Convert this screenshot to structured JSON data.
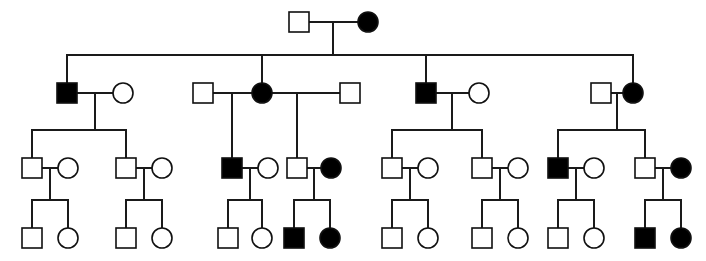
{
  "diagram": {
    "type": "pedigree-chart",
    "generations": 4,
    "symbol_legend": {
      "square": "male",
      "circle": "female",
      "filled": "affected individual",
      "open": "unaffected individual"
    },
    "colors": {
      "affected_fill": "#000000",
      "unaffected_fill": "#ffffff",
      "stroke": "#101010",
      "line": "#1a1a1a",
      "background": "#ffffff"
    },
    "geometry": {
      "width": 706,
      "height": 261,
      "square_size": 20,
      "circle_radius": 10,
      "generation_y": [
        22,
        93,
        168,
        238
      ]
    },
    "counts": {
      "total_individuals": 52,
      "affected_total": 13,
      "affected_males": 6,
      "affected_females": 7
    },
    "individuals": [
      {
        "id": "I-1",
        "generation": 1,
        "sex": "male",
        "affected": false,
        "x": 299,
        "y": 22
      },
      {
        "id": "I-2",
        "generation": 1,
        "sex": "female",
        "affected": true,
        "x": 368,
        "y": 22
      },
      {
        "id": "II-1",
        "generation": 2,
        "sex": "male",
        "affected": true,
        "x": 67,
        "y": 93
      },
      {
        "id": "II-2",
        "generation": 2,
        "sex": "female",
        "affected": false,
        "x": 123,
        "y": 93
      },
      {
        "id": "II-3",
        "generation": 2,
        "sex": "male",
        "affected": false,
        "x": 203,
        "y": 93
      },
      {
        "id": "II-4",
        "generation": 2,
        "sex": "female",
        "affected": true,
        "x": 262,
        "y": 93
      },
      {
        "id": "II-5",
        "generation": 2,
        "sex": "male",
        "affected": false,
        "x": 350,
        "y": 93
      },
      {
        "id": "II-6",
        "generation": 2,
        "sex": "male",
        "affected": true,
        "x": 426,
        "y": 93
      },
      {
        "id": "II-7",
        "generation": 2,
        "sex": "female",
        "affected": false,
        "x": 479,
        "y": 93
      },
      {
        "id": "II-8",
        "generation": 2,
        "sex": "male",
        "affected": false,
        "x": 601,
        "y": 93
      },
      {
        "id": "II-9",
        "generation": 2,
        "sex": "female",
        "affected": true,
        "x": 633,
        "y": 93
      },
      {
        "id": "III-1",
        "generation": 3,
        "sex": "male",
        "affected": false,
        "x": 32,
        "y": 168
      },
      {
        "id": "III-2",
        "generation": 3,
        "sex": "female",
        "affected": false,
        "x": 68,
        "y": 168
      },
      {
        "id": "III-3",
        "generation": 3,
        "sex": "male",
        "affected": false,
        "x": 126,
        "y": 168
      },
      {
        "id": "III-4",
        "generation": 3,
        "sex": "female",
        "affected": false,
        "x": 162,
        "y": 168
      },
      {
        "id": "III-5",
        "generation": 3,
        "sex": "male",
        "affected": true,
        "x": 232,
        "y": 168
      },
      {
        "id": "III-6",
        "generation": 3,
        "sex": "female",
        "affected": false,
        "x": 268,
        "y": 168
      },
      {
        "id": "III-7",
        "generation": 3,
        "sex": "male",
        "affected": false,
        "x": 297,
        "y": 168
      },
      {
        "id": "III-8",
        "generation": 3,
        "sex": "female",
        "affected": true,
        "x": 331,
        "y": 168
      },
      {
        "id": "III-9",
        "generation": 3,
        "sex": "male",
        "affected": false,
        "x": 392,
        "y": 168
      },
      {
        "id": "III-10",
        "generation": 3,
        "sex": "female",
        "affected": false,
        "x": 428,
        "y": 168
      },
      {
        "id": "III-11",
        "generation": 3,
        "sex": "male",
        "affected": false,
        "x": 482,
        "y": 168
      },
      {
        "id": "III-12",
        "generation": 3,
        "sex": "female",
        "affected": false,
        "x": 518,
        "y": 168
      },
      {
        "id": "III-13",
        "generation": 3,
        "sex": "male",
        "affected": true,
        "x": 558,
        "y": 168
      },
      {
        "id": "III-14",
        "generation": 3,
        "sex": "female",
        "affected": false,
        "x": 594,
        "y": 168
      },
      {
        "id": "III-15",
        "generation": 3,
        "sex": "male",
        "affected": false,
        "x": 645,
        "y": 168
      },
      {
        "id": "III-16",
        "generation": 3,
        "sex": "female",
        "affected": true,
        "x": 681,
        "y": 168
      },
      {
        "id": "IV-1",
        "generation": 4,
        "sex": "male",
        "affected": false,
        "x": 32,
        "y": 238
      },
      {
        "id": "IV-2",
        "generation": 4,
        "sex": "female",
        "affected": false,
        "x": 68,
        "y": 238
      },
      {
        "id": "IV-3",
        "generation": 4,
        "sex": "male",
        "affected": false,
        "x": 126,
        "y": 238
      },
      {
        "id": "IV-4",
        "generation": 4,
        "sex": "female",
        "affected": false,
        "x": 162,
        "y": 238
      },
      {
        "id": "IV-5",
        "generation": 4,
        "sex": "male",
        "affected": false,
        "x": 228,
        "y": 238
      },
      {
        "id": "IV-6",
        "generation": 4,
        "sex": "female",
        "affected": false,
        "x": 262,
        "y": 238
      },
      {
        "id": "IV-7",
        "generation": 4,
        "sex": "male",
        "affected": true,
        "x": 294,
        "y": 238
      },
      {
        "id": "IV-8",
        "generation": 4,
        "sex": "female",
        "affected": true,
        "x": 330,
        "y": 238
      },
      {
        "id": "IV-9",
        "generation": 4,
        "sex": "male",
        "affected": false,
        "x": 392,
        "y": 238
      },
      {
        "id": "IV-10",
        "generation": 4,
        "sex": "female",
        "affected": false,
        "x": 428,
        "y": 238
      },
      {
        "id": "IV-11",
        "generation": 4,
        "sex": "male",
        "affected": false,
        "x": 482,
        "y": 238
      },
      {
        "id": "IV-12",
        "generation": 4,
        "sex": "female",
        "affected": false,
        "x": 518,
        "y": 238
      },
      {
        "id": "IV-13",
        "generation": 4,
        "sex": "male",
        "affected": false,
        "x": 558,
        "y": 238
      },
      {
        "id": "IV-14",
        "generation": 4,
        "sex": "female",
        "affected": false,
        "x": 594,
        "y": 238
      },
      {
        "id": "IV-15",
        "generation": 4,
        "sex": "male",
        "affected": true,
        "x": 645,
        "y": 238
      },
      {
        "id": "IV-16",
        "generation": 4,
        "sex": "female",
        "affected": true,
        "x": 681,
        "y": 238
      }
    ],
    "matings": [
      {
        "id": "M1",
        "partners": [
          "I-1",
          "I-2"
        ],
        "mate_y": 22,
        "drop_x": 333,
        "children": [
          "II-1",
          "II-4",
          "II-6",
          "II-9"
        ]
      },
      {
        "id": "M2",
        "partners": [
          "II-1",
          "II-2"
        ],
        "mate_y": 93,
        "drop_x": 95,
        "children": [
          "III-1",
          "III-3"
        ]
      },
      {
        "id": "M3",
        "partners": [
          "II-3",
          "II-4"
        ],
        "mate_y": 93,
        "drop_x": 232,
        "children": [
          "III-5"
        ]
      },
      {
        "id": "M4",
        "partners": [
          "II-4",
          "II-5"
        ],
        "mate_y": 93,
        "drop_x": 297,
        "children": [
          "III-8"
        ]
      },
      {
        "id": "M5",
        "partners": [
          "II-6",
          "II-7"
        ],
        "mate_y": 93,
        "drop_x": 452,
        "children": [
          "III-9",
          "III-11"
        ]
      },
      {
        "id": "M6",
        "partners": [
          "II-8",
          "II-9"
        ],
        "mate_y": 93,
        "drop_x": 617,
        "children": [
          "III-13",
          "III-15"
        ]
      },
      {
        "id": "M7",
        "partners": [
          "III-1",
          "III-2"
        ],
        "mate_y": 168,
        "drop_x": 50,
        "children": [
          "IV-1",
          "IV-2"
        ]
      },
      {
        "id": "M8",
        "partners": [
          "III-3",
          "III-4"
        ],
        "mate_y": 168,
        "drop_x": 144,
        "children": [
          "IV-3",
          "IV-4"
        ]
      },
      {
        "id": "M9",
        "partners": [
          "III-5",
          "III-6"
        ],
        "mate_y": 168,
        "drop_x": 250,
        "children": [
          "IV-5",
          "IV-6"
        ]
      },
      {
        "id": "M10",
        "partners": [
          "III-7",
          "III-8"
        ],
        "mate_y": 168,
        "drop_x": 314,
        "children": [
          "IV-7",
          "IV-8"
        ]
      },
      {
        "id": "M11",
        "partners": [
          "III-9",
          "III-10"
        ],
        "mate_y": 168,
        "drop_x": 410,
        "children": [
          "IV-9",
          "IV-10"
        ]
      },
      {
        "id": "M12",
        "partners": [
          "III-11",
          "III-12"
        ],
        "mate_y": 168,
        "drop_x": 500,
        "children": [
          "IV-11",
          "IV-12"
        ]
      },
      {
        "id": "M13",
        "partners": [
          "III-13",
          "III-14"
        ],
        "mate_y": 168,
        "drop_x": 576,
        "children": [
          "IV-13",
          "IV-14"
        ]
      },
      {
        "id": "M14",
        "partners": [
          "III-15",
          "III-16"
        ],
        "mate_y": 168,
        "drop_x": 663,
        "children": [
          "IV-15",
          "IV-16"
        ]
      }
    ]
  }
}
